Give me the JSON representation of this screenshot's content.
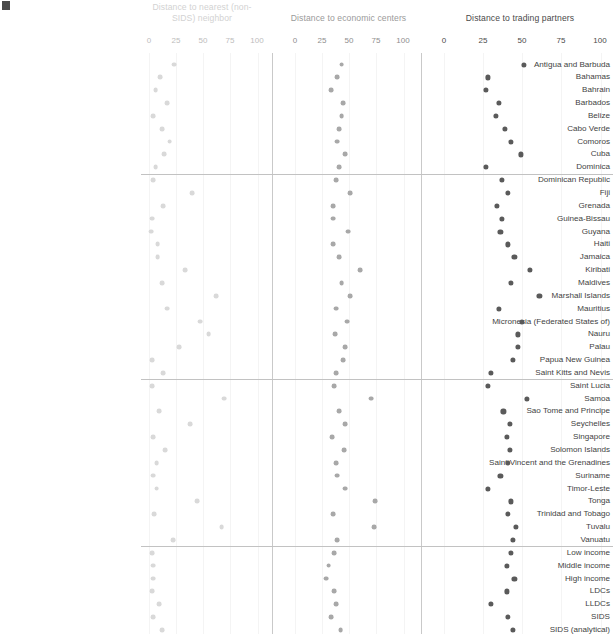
{
  "figure": {
    "corner_mark": "figure-marker",
    "background": "#ffffff"
  },
  "chart_data": {
    "type": "scatter",
    "title": "",
    "xlabel": "",
    "ylabel": "",
    "grid": true,
    "legend_position": "none",
    "panels": [
      {
        "name": "panel-nearest-neighbor",
        "title": "Distance to nearest (non-SIDS) neighbor",
        "color": "#d9d9d9",
        "xlim": [
          0,
          100
        ],
        "ticks": [
          0,
          25,
          50,
          75,
          100
        ]
      },
      {
        "name": "panel-economic-centers",
        "title": "Distance to economic centers",
        "color": "#a8a8a8",
        "xlim": [
          0,
          100
        ],
        "ticks": [
          0,
          25,
          50,
          75,
          100
        ]
      },
      {
        "name": "panel-trading-partners",
        "title": "Distance to trading partners",
        "color": "#5a5a5a",
        "xlim": [
          0,
          100
        ],
        "ticks": [
          0,
          25,
          50,
          75,
          100
        ]
      }
    ],
    "categories": [
      "Antigua and Barbuda",
      "Bahamas",
      "Bahrain",
      "Barbados",
      "Belize",
      "Cabo Verde",
      "Comoros",
      "Cuba",
      "Dominica",
      "Dominican Republic",
      "Fiji",
      "Grenada",
      "Guinea-Bissau",
      "Guyana",
      "Haiti",
      "Jamaica",
      "Kiribati",
      "Maldives",
      "Marshall Islands",
      "Mauritius",
      "Micronesia (Federated States of)",
      "Nauru",
      "Palau",
      "Papua New Guinea",
      "Saint Kitts and Nevis",
      "Saint Lucia",
      "Samoa",
      "Sao Tome and Principe",
      "Seychelles",
      "Singapore",
      "Solomon Islands",
      "Saint Vincent and the Grenadines",
      "Suriname",
      "Timor-Leste",
      "Tonga",
      "Trinidad and Tobago",
      "Tuvalu",
      "Vanuatu",
      "Low income",
      "Middle income",
      "High income",
      "LDCs",
      "LLDCs",
      "SIDS",
      "SIDS (analytical)"
    ],
    "series": [
      {
        "name": "Distance to nearest (non-SIDS) neighbor",
        "panel": 0,
        "values": [
          23,
          10,
          6,
          17,
          4,
          12,
          19,
          14,
          6,
          4,
          40,
          13,
          3,
          2,
          8,
          8,
          33,
          12,
          62,
          17,
          47,
          55,
          28,
          3,
          13,
          3,
          69,
          9,
          38,
          4,
          15,
          7,
          4,
          7,
          44,
          5,
          67,
          22,
          3,
          4,
          4,
          3,
          9,
          4,
          12
        ]
      },
      {
        "name": "Distance to economic centers",
        "panel": 1,
        "values": [
          43,
          39,
          33,
          44,
          43,
          41,
          39,
          46,
          41,
          38,
          51,
          35,
          35,
          49,
          35,
          41,
          60,
          43,
          51,
          38,
          48,
          37,
          46,
          44,
          38,
          36,
          70,
          41,
          46,
          34,
          45,
          38,
          39,
          46,
          74,
          35,
          73,
          39,
          36,
          31,
          29,
          36,
          38,
          33,
          42
        ]
      },
      {
        "name": "Distance to trading partners",
        "panel": 2,
        "values": [
          51,
          28,
          27,
          35,
          33,
          39,
          43,
          49,
          27,
          37,
          41,
          34,
          37,
          36,
          41,
          45,
          55,
          43,
          61,
          35,
          50,
          47,
          47,
          44,
          30,
          28,
          53,
          38,
          42,
          40,
          42,
          41,
          36,
          28,
          43,
          41,
          46,
          44,
          43,
          40,
          45,
          40,
          30,
          41,
          44
        ]
      }
    ],
    "group_separators_after": [
      "Dominica",
      "Saint Kitts and Nevis",
      "Vanuatu"
    ]
  }
}
